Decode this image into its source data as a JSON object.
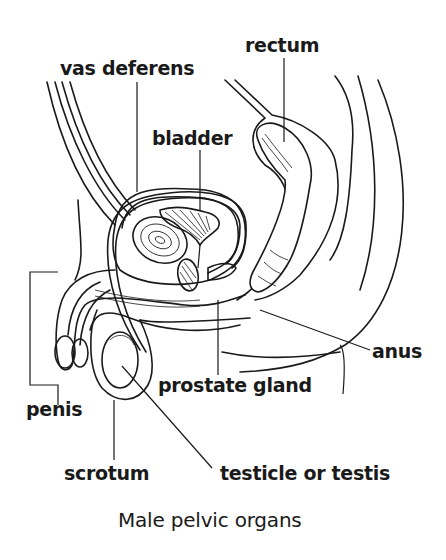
{
  "diagram": {
    "title": "Male pelvic organs",
    "labels": {
      "rectum": "rectum",
      "vas_deferens": "vas deferens",
      "bladder": "bladder",
      "anus": "anus",
      "prostate_gland": "prostate gland",
      "penis": "penis",
      "scrotum": "scrotum",
      "testicle": "testicle or testis"
    }
  },
  "colors": {
    "ink": "#1a1a1a",
    "background": "#ffffff"
  }
}
